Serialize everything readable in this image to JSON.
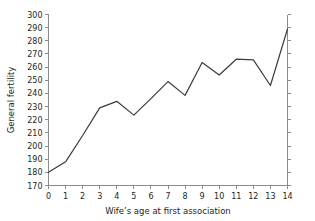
{
  "chart_data": {
    "type": "line",
    "title": "",
    "xlabel": "Wife’s age at first association",
    "ylabel": "General fertility",
    "x": [
      0,
      1,
      2,
      3,
      4,
      5,
      6,
      7,
      8,
      9,
      10,
      11,
      12,
      13,
      14
    ],
    "values": [
      180,
      188,
      208,
      229,
      234,
      223.5,
      236,
      249,
      238.5,
      263.5,
      254,
      266,
      265.5,
      246,
      289
    ],
    "series": [
      {
        "name": "General fertility",
        "values": [
          180,
          188,
          208,
          229,
          234,
          223.5,
          236,
          249,
          238.5,
          263.5,
          254,
          266,
          265.5,
          246,
          289
        ]
      }
    ],
    "xlim": [
      0,
      14
    ],
    "ylim": [
      170,
      300
    ],
    "xticks": [
      0,
      1,
      2,
      3,
      4,
      5,
      6,
      7,
      8,
      9,
      10,
      11,
      12,
      13,
      14
    ],
    "xtick_labels": [
      "0",
      "1",
      "2",
      "3",
      "4",
      "5",
      "6",
      "7",
      "8",
      "9",
      "10",
      "11",
      "12",
      "13",
      "14"
    ],
    "yticks": [
      170,
      180,
      190,
      200,
      210,
      220,
      230,
      240,
      250,
      260,
      270,
      280,
      290,
      300
    ],
    "ytick_labels": [
      "170",
      "180",
      "190",
      "200",
      "210",
      "220",
      "230",
      "240",
      "250",
      "260",
      "270",
      "280",
      "290",
      "300"
    ],
    "grid": false,
    "legend": false,
    "legend_position": "none",
    "line_color": "#3b3b3b",
    "axis_color": "#8c8c8c",
    "background_color": "#ffffff",
    "right_axis_visible": true
  }
}
